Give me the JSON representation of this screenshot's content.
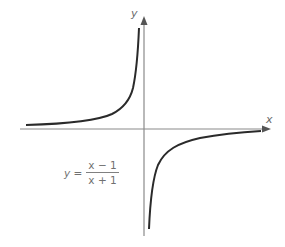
{
  "figure": {
    "type": "function-graph",
    "x_axis_label": "x",
    "y_axis_label": "y",
    "equation": {
      "lhs": "y =",
      "numerator": "x − 1",
      "denominator": "x + 1"
    },
    "colors": {
      "curve": "#2a2a2a",
      "axis": "#8a8a8a",
      "text": "#6a6a6a",
      "background": "#ffffff"
    },
    "features": {
      "vertical_asymptote": "near y-axis (left of it)",
      "horizontal_asymptote": "near x-axis",
      "branches": [
        "upper-left",
        "lower-right"
      ]
    }
  }
}
